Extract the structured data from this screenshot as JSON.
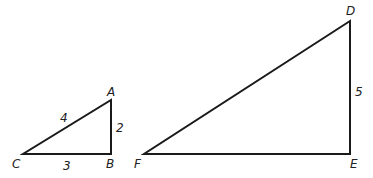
{
  "diagram": {
    "triangles": [
      {
        "name": "ABC",
        "vertices": [
          {
            "label": "A",
            "x": 111,
            "y": 100
          },
          {
            "label": "B",
            "x": 111,
            "y": 154
          },
          {
            "label": "C",
            "x": 23,
            "y": 154
          }
        ],
        "sides": [
          {
            "between": "CA",
            "label": "4"
          },
          {
            "between": "AB",
            "label": "2"
          },
          {
            "between": "CB",
            "label": "3"
          }
        ]
      },
      {
        "name": "DEF",
        "vertices": [
          {
            "label": "D",
            "x": 350,
            "y": 21
          },
          {
            "label": "E",
            "x": 350,
            "y": 154
          },
          {
            "label": "F",
            "x": 144,
            "y": 154
          }
        ],
        "sides": [
          {
            "between": "DE",
            "label": "5"
          }
        ]
      }
    ],
    "labels": {
      "A": "A",
      "B": "B",
      "C": "C",
      "D": "D",
      "E": "E",
      "F": "F",
      "side_CA": "4",
      "side_AB": "2",
      "side_CB": "3",
      "side_DE": "5"
    },
    "colors": {
      "stroke": "#1a1a1a",
      "text": "#222222",
      "background": "#ffffff"
    }
  }
}
